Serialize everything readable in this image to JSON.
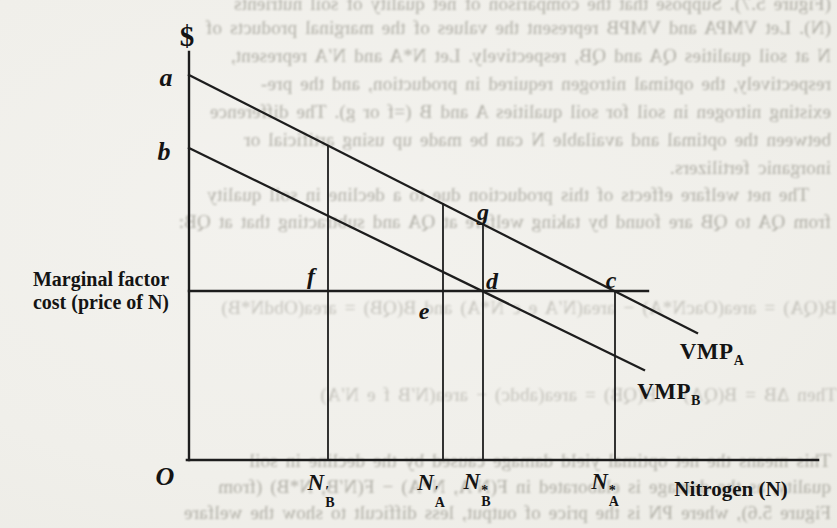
{
  "figure": {
    "currency_axis_label": "$",
    "origin_label": "O",
    "x_axis_title": "Nitrogen (N)",
    "marginal_factor_cost_label": {
      "line1": "Marginal factor",
      "line2": "cost (price of N)"
    },
    "point_labels": {
      "a": "a",
      "b": "b",
      "c": "c",
      "d": "d",
      "e": "e",
      "f": "f",
      "g": "g"
    },
    "curve_labels": {
      "vmp_a": {
        "base": "VMP",
        "sub": "A"
      },
      "vmp_b": {
        "base": "VMP",
        "sub": "B"
      }
    },
    "x_axis_ticks": [
      {
        "base": "N",
        "sup": "′",
        "sub": "B"
      },
      {
        "base": "N",
        "sup": "′",
        "sub": "A"
      },
      {
        "base": "N",
        "sup": "*",
        "sub": "B"
      },
      {
        "base": "N",
        "sup": "*",
        "sub": "A"
      }
    ],
    "line_color": "#1d1d1d",
    "paper_color": "#f1f0ec"
  },
  "bleed_through_text": {
    "description": "faint mirrored text bleeding through from the reverse page of the scan",
    "lines": [
      "(Figure 5.7). Suppose that the comparison of net quality of soil nutrients",
      "(N). Let VMPA and VMPB represent the values of the marginal products of",
      "N at soil qualities QA and QB, respectively. Let N*A and N′A represent,",
      "respectively, the optimal nitrogen required in production, and the pre-",
      "existing nitrogen in soil for soil qualities A and B (=f or g). The difference",
      "between the optimal and available N can be made up using artificial or",
      "inorganic fertilizers.",
      "The net welfare effects of this production due to a decline in soil quality",
      "from QA to QB are found by taking welfare at QA and subtracting that at QB:",
      "B(QA) = area(OacN*A) − area(N′A e c N*A) and B(QB) = area(ObdN*B)",
      "Then ΔB = B(QA) − B(QB) = area(abdc) − area(N′B f e N′A)",
      "This means the net optimal yield damage caused by the decline in soil",
      "quality, as the damage is elaborated in F(N′A, N*A) − F(N′B, N*B) (from",
      "Figure 5.6), where PN is the price of output, less difficult to show the welfare"
    ]
  }
}
